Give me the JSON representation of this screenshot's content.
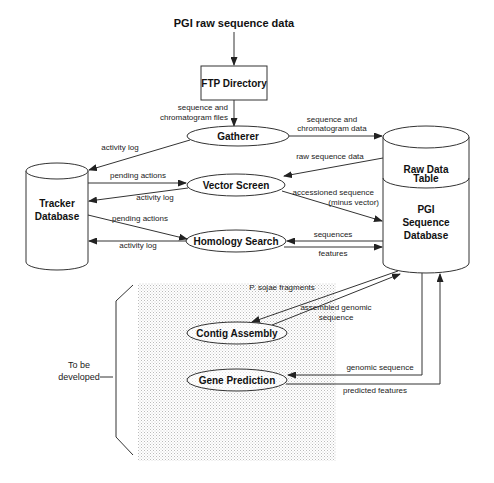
{
  "diagram": {
    "title": "PGI raw sequence data",
    "nodes": {
      "ftp": "FTP Directory",
      "gatherer": "Gatherer",
      "vector_screen": "Vector Screen",
      "homology_search": "Homology Search",
      "contig_assembly": "Contig Assembly",
      "gene_prediction": "Gene Prediction",
      "tracker": [
        "Tracker",
        "Database"
      ],
      "raw_table": [
        "Raw Data",
        "Table"
      ],
      "pgi_db": [
        "PGI",
        "Sequence",
        "Database"
      ]
    },
    "edges": {
      "ftp_to_gatherer": [
        "sequence and",
        "chromatogram files"
      ],
      "gatherer_to_raw": [
        "sequence and",
        "chromatogram data"
      ],
      "gatherer_to_tracker": "activity log",
      "tracker_to_vector": "pending actions",
      "vector_to_tracker": "activity log",
      "raw_to_vector": "raw sequence data",
      "vector_to_pgi": [
        "accessioned sequence",
        "(minus vector)"
      ],
      "tracker_to_homology": "pending actions",
      "homology_to_tracker": "activity log",
      "pgi_to_homology": "sequences",
      "homology_to_pgi": "features",
      "pgi_to_contig": "P. sojae fragments",
      "contig_to_pgi": [
        "assembled genomic",
        "sequence"
      ],
      "pgi_to_gene": "genomic sequence",
      "gene_to_pgi": "predicted features"
    },
    "bracket_label": [
      "To be",
      "developed"
    ]
  }
}
